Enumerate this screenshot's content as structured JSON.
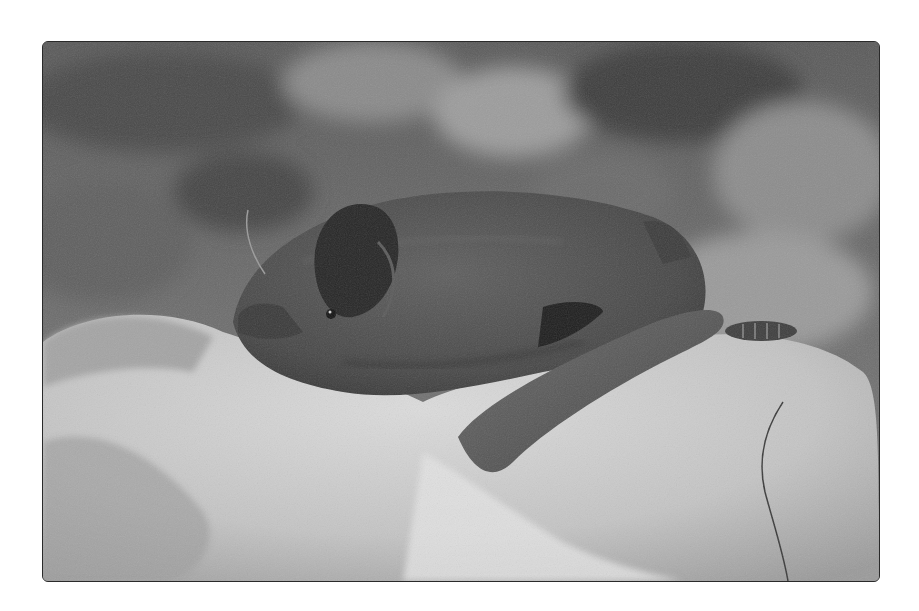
{
  "image": {
    "subject": "bat resting on a rock",
    "style": "black-and-white photograph",
    "frame": {
      "x": 42,
      "y": 41,
      "width": 836,
      "height": 539,
      "border_color": "#2a2a2a",
      "background": "#ffffff"
    },
    "tones": {
      "background_dark": "#4a4a4a",
      "background_mid": "#7a7a7a",
      "background_light": "#a8a8a8",
      "bat_fur": "#4f4f4f",
      "bat_shadow": "#2c2c2c",
      "ear": "#262626",
      "rock_light": "#d8d8d8",
      "rock_mid": "#bdbdbd",
      "rock_shadow": "#8e8e8e",
      "forearm": "#5a5a5a"
    }
  }
}
